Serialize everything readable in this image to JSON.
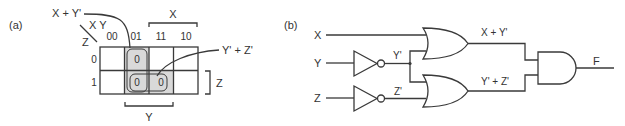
{
  "panel_a": {
    "label": "(a)",
    "corner_labels": {
      "columns": "X Y",
      "rows": "Z"
    },
    "column_headers": [
      "00",
      "01",
      "11",
      "10"
    ],
    "row_headers": [
      "0",
      "1"
    ],
    "cells": [
      [
        "",
        "0",
        "",
        ""
      ],
      [
        "",
        "0",
        "0",
        ""
      ]
    ],
    "shaded_cells": [
      [
        0,
        1
      ],
      [
        1,
        1
      ],
      [
        1,
        2
      ]
    ],
    "groups": [
      {
        "name": "X + Y'",
        "cells": [
          [
            0,
            1
          ],
          [
            1,
            1
          ]
        ]
      },
      {
        "name": "Y' + Z'",
        "cells": [
          [
            1,
            1
          ],
          [
            1,
            2
          ]
        ]
      }
    ],
    "brackets": {
      "top": "X",
      "right": "Z",
      "bottom": "Y"
    },
    "annotations": {
      "group1": "X + Y'",
      "group2": "Y' + Z'"
    },
    "colors": {
      "shade": "#d9d9d9",
      "line": "#3a3a3a"
    }
  },
  "panel_b": {
    "label": "(b)",
    "inputs": [
      "X",
      "Y",
      "Z"
    ],
    "inverter_outputs": [
      "Y'",
      "Z'"
    ],
    "or_gate_outputs": [
      "X + Y'",
      "Y' + Z'"
    ],
    "output": "F",
    "gates": [
      {
        "type": "NOT",
        "input": "Y",
        "output": "Y'"
      },
      {
        "type": "NOT",
        "input": "Z",
        "output": "Z'"
      },
      {
        "type": "OR",
        "inputs": [
          "X",
          "Y'"
        ],
        "output": "X + Y'"
      },
      {
        "type": "OR",
        "inputs": [
          "Y'",
          "Z'"
        ],
        "output": "Y' + Z'"
      },
      {
        "type": "AND",
        "inputs": [
          "X + Y'",
          "Y' + Z'"
        ],
        "output": "F"
      }
    ]
  }
}
